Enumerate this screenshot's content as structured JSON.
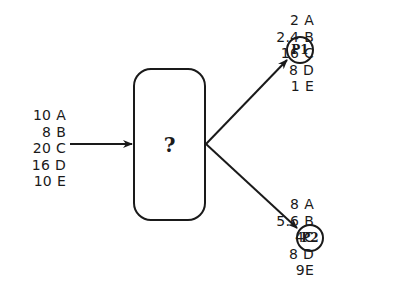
{
  "diagram": {
    "type": "flow-split",
    "process": {
      "label": "?"
    },
    "feed": {
      "components": [
        {
          "amount": "10",
          "label": "A"
        },
        {
          "amount": "8",
          "label": "B"
        },
        {
          "amount": "20",
          "label": "C"
        },
        {
          "amount": "16",
          "label": "D"
        },
        {
          "amount": "10",
          "label": "E"
        }
      ]
    },
    "products": [
      {
        "label": "P1",
        "components": [
          {
            "amount": "2",
            "label": "A"
          },
          {
            "amount": "2.4",
            "label": "B"
          },
          {
            "amount": "16",
            "label": "C"
          },
          {
            "amount": "8",
            "label": "D"
          },
          {
            "amount": "1",
            "label": "E"
          }
        ]
      },
      {
        "label": "P2",
        "components": [
          {
            "amount": "8",
            "label": "A"
          },
          {
            "amount": "5.6",
            "label": "B"
          },
          {
            "amount": "4",
            "label": "C"
          },
          {
            "amount": "8",
            "label": "D"
          },
          {
            "amount": "9",
            "label": "E"
          }
        ]
      }
    ],
    "colors": {
      "stroke": "#1a1a1a",
      "background": "#ffffff"
    }
  }
}
